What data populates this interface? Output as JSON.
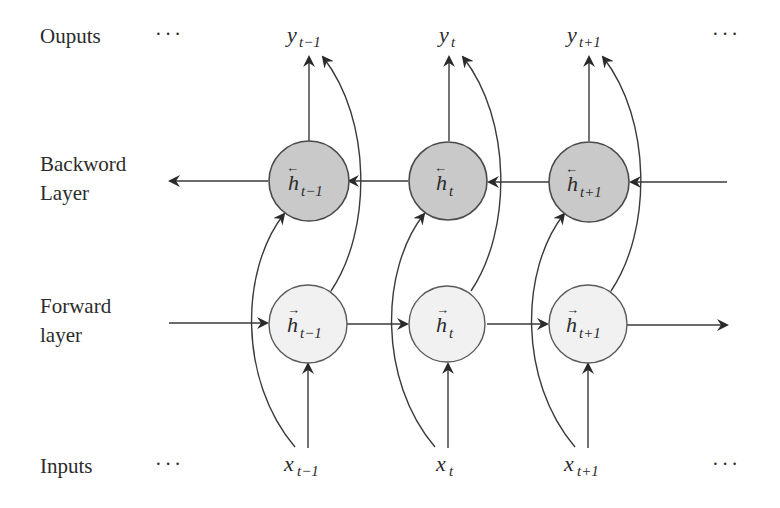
{
  "rows": {
    "outputs": {
      "label": "Ouputs",
      "dots_left": "···",
      "dots_right": "···"
    },
    "backward": {
      "label_line1": "Backword",
      "label_line2": "Layer"
    },
    "forward": {
      "label_line1": "Forward",
      "label_line2": "layer"
    },
    "inputs": {
      "label": "Inputs",
      "dots_left": "···",
      "dots_right": "···"
    }
  },
  "timesteps": [
    {
      "output": {
        "base": "y",
        "sub": "t−1"
      },
      "backward_state": {
        "base": "h",
        "sub": "t−1",
        "arrow": "←"
      },
      "forward_state": {
        "base": "h",
        "sub": "t−1",
        "arrow": "→"
      },
      "input": {
        "base": "x",
        "sub": "t−1"
      }
    },
    {
      "output": {
        "base": "y",
        "sub": "t"
      },
      "backward_state": {
        "base": "h",
        "sub": "t",
        "arrow": "←"
      },
      "forward_state": {
        "base": "h",
        "sub": "t",
        "arrow": "→"
      },
      "input": {
        "base": "x",
        "sub": "t"
      }
    },
    {
      "output": {
        "base": "y",
        "sub": "t+1"
      },
      "backward_state": {
        "base": "h",
        "sub": "t+1",
        "arrow": "←"
      },
      "forward_state": {
        "base": "h",
        "sub": "t+1",
        "arrow": "→"
      },
      "input": {
        "base": "x",
        "sub": "t+1"
      }
    }
  ],
  "colors": {
    "backward_node_fill": "#c9c9c9",
    "forward_node_fill": "#f1f1f1",
    "stroke": "#3a3a3a",
    "text": "#2b2b2b"
  }
}
